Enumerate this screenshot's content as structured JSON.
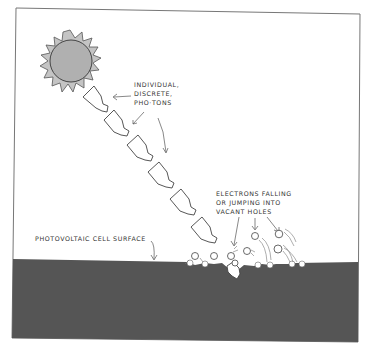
{
  "diagram": {
    "labels": {
      "photons": [
        "INDIVIDUAL,",
        "DISCRETE,",
        "PHO·TONS"
      ],
      "electrons": [
        "ELECTRONS  FALLING",
        "OR  JUMPING   INTO",
        "VACANT  HOLES"
      ],
      "surface": "PHOTOVOLTAIC   CELL   SURFACE"
    },
    "elements": {
      "sun": "sun-icon",
      "photon_count": 7,
      "electron_count": 11
    },
    "colors": {
      "ground": "#555555",
      "sun_fill": "#b0b0b0",
      "sun_rays": "#c4c4c4",
      "stroke": "#444444",
      "frame": "#777777"
    }
  }
}
